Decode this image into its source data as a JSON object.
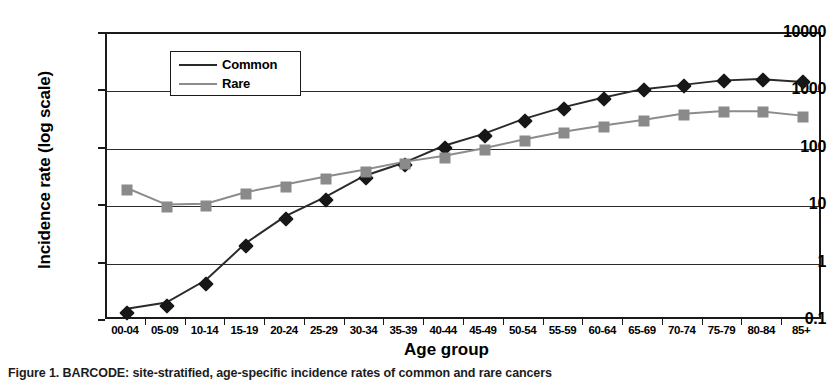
{
  "figure": {
    "caption": "Figure 1. BARCODE: site-stratified, age-specific incidence rates of common and rare cancers"
  },
  "axes": {
    "y_title": "Incidence rate (log scale)",
    "x_title": "Age group",
    "y_ticks": [
      "10000",
      "1000",
      "100",
      "10",
      "1",
      "0.1"
    ]
  },
  "legend": {
    "items": [
      {
        "label": "Common",
        "marker": "diamond-marker",
        "color": "#171717"
      },
      {
        "label": "Rare",
        "marker": "square-marker",
        "color": "#8a8a8a"
      }
    ]
  },
  "chart_data": {
    "type": "line",
    "title": "",
    "xlabel": "Age group",
    "ylabel": "Incidence rate (log scale)",
    "yscale": "log",
    "ylim": [
      0.1,
      10000
    ],
    "grid": true,
    "legend_position": "upper-left-inside",
    "categories": [
      "00-04",
      "05-09",
      "10-14",
      "15-19",
      "20-24",
      "25-29",
      "30-34",
      "35-39",
      "40-44",
      "45-49",
      "50-54",
      "55-59",
      "60-64",
      "65-69",
      "70-74",
      "75-79",
      "80-84",
      "85+"
    ],
    "series": [
      {
        "name": "Common",
        "color": "#171717",
        "marker": "diamond",
        "values": [
          0.14,
          0.18,
          0.45,
          2.0,
          6.0,
          13,
          31,
          53,
          105,
          170,
          310,
          500,
          740,
          1050,
          1250,
          1500,
          1600,
          1430
        ]
      },
      {
        "name": "Rare",
        "color": "#8a8a8a",
        "marker": "square",
        "values": [
          19,
          9.7,
          10,
          16,
          22,
          30,
          40,
          55,
          70,
          95,
          135,
          185,
          240,
          300,
          385,
          430,
          430,
          365
        ]
      }
    ]
  }
}
